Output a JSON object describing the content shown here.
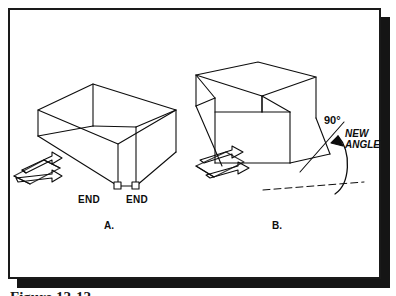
{
  "figure": {
    "domain_note": "technical line illustration, two isometric wireframe panel-box diagrams",
    "caption_clipped": "Figure 12-12",
    "frame": {
      "border_color": "#1a1a1a",
      "shadow_color": "#151515",
      "background_color": "#ffffff"
    },
    "ink_color": "#0d0d0d"
  },
  "panels": [
    {
      "id": "panel-a",
      "label": "A.",
      "label_x": 104,
      "label_y": 227,
      "end_markers": [
        {
          "label": "END",
          "text_x": 78,
          "text_y": 200,
          "box_x": 87,
          "box_y": 186
        },
        {
          "label": "END",
          "text_x": 126,
          "text_y": 200,
          "box_x": 135,
          "box_y": 186
        }
      ]
    },
    {
      "id": "panel-b",
      "label": "B.",
      "label_x": 272,
      "label_y": 227,
      "annotations": {
        "angle_value": "90°",
        "angle_value_x": 324,
        "angle_value_y": 120,
        "new_angle_line1": "NEW",
        "new_angle_line2": "ANGLE",
        "new_angle_x": 345,
        "new_angle_y": 134
      }
    }
  ]
}
